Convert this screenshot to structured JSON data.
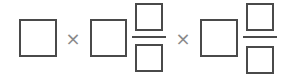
{
  "expression": {
    "operators": [
      "×",
      "×"
    ],
    "terms": [
      {
        "type": "box"
      },
      {
        "type": "mixed-number",
        "whole": "box",
        "numerator": "box",
        "denominator": "box"
      },
      {
        "type": "mixed-number",
        "whole": "box",
        "numerator": "box",
        "denominator": "box"
      }
    ]
  },
  "colors": {
    "stroke": "#4a4a4a",
    "operator": "#8a8a8a",
    "background": "#ffffff"
  }
}
